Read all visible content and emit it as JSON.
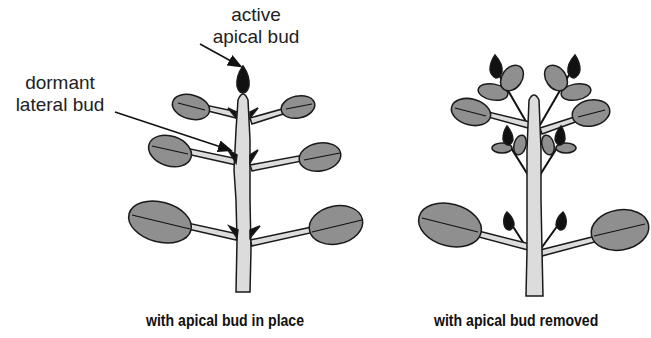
{
  "labels": {
    "apical_bud": {
      "line1": "active",
      "line2": "apical bud"
    },
    "lateral_bud": {
      "line1": "dormant",
      "line2": "lateral bud"
    }
  },
  "captions": {
    "left": "with apical bud in place",
    "right": "with apical bud removed"
  },
  "colors": {
    "leaf_fill": "#8f8f8f",
    "stem_fill": "#dcdcdc",
    "bud_fill": "#111111",
    "outline": "#1a1a1a"
  }
}
